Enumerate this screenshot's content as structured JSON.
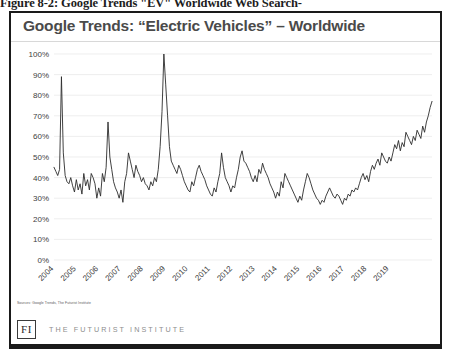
{
  "figure": {
    "caption": "Figure 8-2: Google Trends \"EV\" Worldwide Web Search-"
  },
  "chart": {
    "title": "Google Trends: “Electric Vehicles” – Worldwide",
    "source_note": "Sources: Google Trends, The Futurist Institute"
  },
  "footer": {
    "logo_text": "FI",
    "wordmark": "THE FUTURIST INSTITUTE"
  },
  "colors": {
    "line": "#2b2b2b",
    "grid": "#e6e6e6",
    "frame": "#1a1a1a",
    "title": "#4a4a4a",
    "axis_text": "#404040",
    "wordmark": "#8d8d8d"
  },
  "chart_data": {
    "type": "line",
    "title": "Google Trends: “Electric Vehicles” – Worldwide",
    "xlabel": "",
    "ylabel": "",
    "ylim": [
      0,
      100
    ],
    "yticks": [
      0,
      10,
      20,
      30,
      40,
      50,
      60,
      70,
      80,
      90,
      100
    ],
    "ytick_labels": [
      "0%",
      "10%",
      "20%",
      "30%",
      "40%",
      "50%",
      "60%",
      "70%",
      "80%",
      "90%",
      "100%"
    ],
    "grid": true,
    "legend": false,
    "xtick_labels": [
      "2004",
      "2005",
      "2006",
      "2007",
      "2008",
      "2009",
      "2010",
      "2011",
      "2012",
      "2013",
      "2014",
      "2015",
      "2016",
      "2017",
      "2018",
      "2019"
    ],
    "x_start": "2004-01",
    "x_end": "2019-12",
    "x_interval": "monthly",
    "series": [
      {
        "name": "Electric Vehicles search interest",
        "values": [
          45,
          43,
          41,
          44,
          89,
          52,
          41,
          38,
          37,
          40,
          36,
          33,
          39,
          34,
          37,
          32,
          42,
          36,
          39,
          34,
          42,
          40,
          37,
          30,
          35,
          31,
          42,
          38,
          45,
          67,
          50,
          44,
          38,
          35,
          33,
          30,
          34,
          28,
          38,
          42,
          52,
          48,
          44,
          40,
          46,
          43,
          41,
          38,
          40,
          37,
          36,
          34,
          38,
          36,
          40,
          38,
          44,
          55,
          72,
          100,
          85,
          70,
          55,
          48,
          46,
          44,
          42,
          46,
          44,
          41,
          38,
          36,
          34,
          33,
          38,
          36,
          40,
          44,
          46,
          43,
          41,
          39,
          36,
          34,
          32,
          31,
          35,
          33,
          38,
          42,
          52,
          45,
          40,
          38,
          36,
          33,
          36,
          35,
          40,
          44,
          50,
          53,
          48,
          47,
          45,
          43,
          40,
          38,
          41,
          38,
          44,
          42,
          47,
          44,
          42,
          40,
          37,
          35,
          33,
          30,
          33,
          31,
          38,
          35,
          42,
          40,
          38,
          36,
          34,
          32,
          30,
          28,
          31,
          29,
          34,
          38,
          42,
          40,
          37,
          34,
          32,
          30,
          29,
          27,
          29,
          28,
          31,
          33,
          35,
          33,
          31,
          30,
          32,
          31,
          29,
          27,
          30,
          29,
          32,
          31,
          34,
          33,
          35,
          34,
          37,
          40,
          42,
          39,
          41,
          38,
          43,
          46,
          44,
          47,
          49,
          46,
          52,
          50,
          48,
          47,
          50,
          48,
          52,
          56,
          54,
          58,
          53,
          57,
          55,
          62,
          60,
          58,
          56,
          60,
          58,
          63,
          61,
          59,
          65,
          62,
          67,
          70,
          74,
          77
        ]
      }
    ],
    "annotations": [
      {
        "label": "peak",
        "x": "2008-12",
        "y": 100
      },
      {
        "label": "early spike",
        "x": "2004-05",
        "y": 89
      },
      {
        "label": "trough",
        "x": "2014-12",
        "y": 27
      },
      {
        "label": "final",
        "x": "2019-12",
        "y": 77
      }
    ]
  }
}
